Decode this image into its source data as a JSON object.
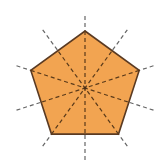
{
  "diagram": {
    "type": "regular-pentagon-lines-of-symmetry",
    "shape": "regular pentagon",
    "lines_of_symmetry": 5,
    "center": [
      85,
      88
    ],
    "radius": 57,
    "line_extent": 72,
    "vertex_angles_deg": [
      -90,
      -18,
      54,
      126,
      198
    ],
    "colors": {
      "fill": "#F2A451",
      "stroke": "#5a3a22",
      "symmetry_line_outside": "#707070",
      "symmetry_line_inside": "#4a3018",
      "background": "#ffffff"
    }
  }
}
